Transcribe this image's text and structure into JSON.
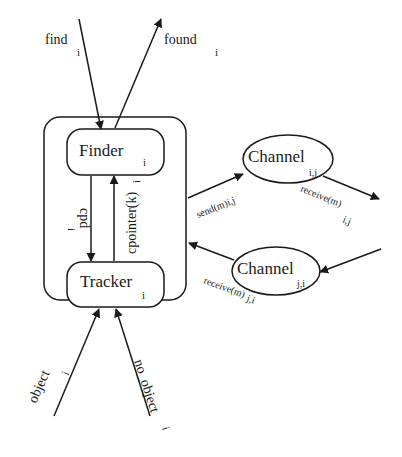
{
  "diagram": {
    "nodes": {
      "finder": {
        "label": "Finder",
        "sub": "i"
      },
      "tracker": {
        "label": "Tracker",
        "sub": "i"
      },
      "channel_ij": {
        "label": "Channel",
        "sub": "i,j"
      },
      "channel_ji": {
        "label": "Channel",
        "sub": "j,i"
      }
    },
    "edges": {
      "find": {
        "label": "find",
        "sub": "i"
      },
      "found": {
        "label": "found",
        "sub": "i"
      },
      "cpd": {
        "label": "cpd",
        "sub": "i"
      },
      "cpointer": {
        "label": "cpointer(k)",
        "sub": "i"
      },
      "send": {
        "label": "send(m)i,j"
      },
      "receive_ij": {
        "label": "receive(m)",
        "sub": "i,j"
      },
      "receive_ji": {
        "label": "receive(m)",
        "sub": "j,i"
      },
      "object": {
        "label": "object",
        "sub": "i"
      },
      "no_object": {
        "label": "no_object",
        "sub": "i"
      }
    },
    "stroke_color": "#1a1a1a",
    "background_color": "#ffffff"
  }
}
